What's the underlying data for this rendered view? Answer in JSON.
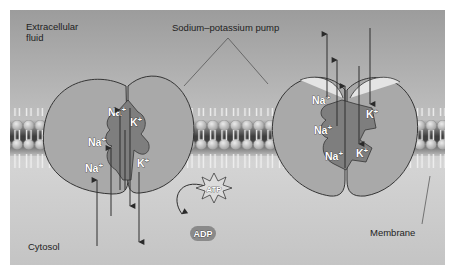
{
  "labels": {
    "extracellular": "Extracellular\nfluid",
    "extracellular_line1": "Extracellular",
    "extracellular_line2": "fluid",
    "pump": "Sodium–potassium pump",
    "cytosol": "Cytosol",
    "membrane": "Membrane",
    "atp": "ATP",
    "adp": "ADP"
  },
  "ions": {
    "sodium": "Na",
    "potassium": "K",
    "charge": "+"
  },
  "left_pump": {
    "state": "open to cytosol",
    "sodium_sites": 3,
    "potassium_sites": 2
  },
  "right_pump": {
    "state": "open to extracellular fluid",
    "sodium_sites": 3,
    "potassium_sites": 2
  },
  "colors": {
    "background_top": "#9a9a9a",
    "background_bottom": "#e2e2e2",
    "protein": "#a8a8a8",
    "protein_outline": "#3a3a3a",
    "channel": "#7d7d7d",
    "arrow": "#2e2e2e",
    "lipid_head": "#c9c9c9",
    "membrane_core": "#4a4a4a"
  }
}
